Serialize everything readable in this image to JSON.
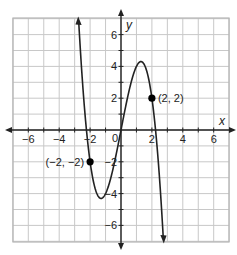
{
  "chart_data": {
    "type": "line",
    "title": "",
    "xlabel": "x",
    "ylabel": "y",
    "xlim": [
      -7,
      7
    ],
    "ylim": [
      -7,
      7
    ],
    "grid": true,
    "x_ticks": [
      -6,
      -4,
      -2,
      0,
      2,
      4,
      6
    ],
    "y_ticks": [
      -6,
      -4,
      -2,
      2,
      4,
      6
    ],
    "x_tick_labels": [
      "−6",
      "−4",
      "−2",
      "2",
      "4",
      "6"
    ],
    "y_tick_labels": [
      "6",
      "4",
      "2",
      "−2",
      "−4",
      "−6"
    ],
    "origin_label": "0",
    "function": "y = -x^3 + 5x",
    "curve_samples": {
      "x": [
        -2.75,
        -2.5,
        -2.24,
        -2,
        -1.5,
        -1.29,
        -1,
        -0.5,
        0,
        0.5,
        1,
        1.29,
        1.5,
        2,
        2.24,
        2.5,
        2.75
      ],
      "y": [
        7.05,
        3.13,
        0,
        -2,
        -4.13,
        -4.3,
        -4,
        -2.38,
        0,
        2.38,
        4,
        4.3,
        4.13,
        2,
        0,
        -3.13,
        -7.05
      ]
    },
    "labeled_points": [
      {
        "x": -2,
        "y": -2,
        "label": "(−2, −2)"
      },
      {
        "x": 2,
        "y": 2,
        "label": "(2, 2)"
      }
    ],
    "colors": {
      "curve": "#222222",
      "grid": "#c8c8c8",
      "axis": "#222222",
      "point": "#000000"
    }
  }
}
